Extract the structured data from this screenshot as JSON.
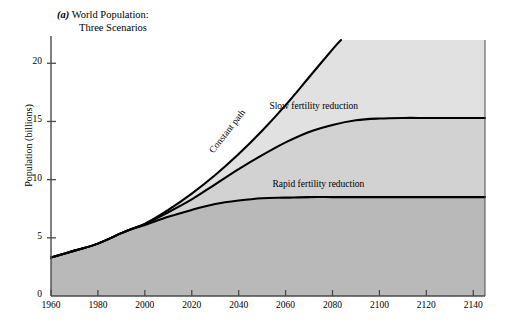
{
  "figure": {
    "panel_letter": "(a)",
    "title_line1": "World Population:",
    "title_line2": "Three Scenarios"
  },
  "colors": {
    "band_top": "#e1e1e1",
    "band_middle": "#d2d2d2",
    "band_bottom": "#b9b9b9",
    "curve": "#000000",
    "axis": "#4a4a4a",
    "background": "#ffffff"
  },
  "chart_data": {
    "type": "line",
    "title": "(a) World Population: Three Scenarios",
    "xlabel": "",
    "ylabel": "Population (billions)",
    "xlim": [
      1960,
      2145
    ],
    "ylim": [
      0,
      22
    ],
    "grid": false,
    "legend": "inline-curve-labels",
    "xticks": [
      1960,
      1980,
      2000,
      2020,
      2040,
      2060,
      2080,
      2100,
      2120,
      2140
    ],
    "yticks": [
      0,
      5,
      10,
      15,
      20
    ],
    "origin_label": "0",
    "annotations": [
      {
        "text": "Constant path",
        "x": 2030,
        "y": 13.0,
        "rotation": -52
      },
      {
        "text": "Slow fertility reduction",
        "x": 2072,
        "y": 15.9,
        "rotation": 0
      },
      {
        "text": "Rapid fertility reduction",
        "x": 2074,
        "y": 9.2,
        "rotation": 0
      }
    ],
    "series": [
      {
        "name": "Constant path",
        "x": [
          1960,
          1970,
          1980,
          1990,
          1995,
          2000,
          2010,
          2020,
          2030,
          2040,
          2050,
          2060,
          2070,
          2080,
          2085
        ],
        "values": [
          3.3,
          3.9,
          4.5,
          5.4,
          5.8,
          6.2,
          7.4,
          8.8,
          10.4,
          12.2,
          14.2,
          16.4,
          18.8,
          21.2,
          22.3
        ]
      },
      {
        "name": "Slow fertility reduction",
        "x": [
          1960,
          1970,
          1980,
          1990,
          1995,
          2000,
          2010,
          2020,
          2030,
          2040,
          2050,
          2060,
          2070,
          2080,
          2090,
          2100,
          2110,
          2120,
          2130,
          2140,
          2145
        ],
        "values": [
          3.3,
          3.9,
          4.5,
          5.4,
          5.8,
          6.2,
          7.2,
          8.3,
          9.6,
          10.9,
          12.1,
          13.2,
          14.1,
          14.7,
          15.1,
          15.25,
          15.3,
          15.3,
          15.3,
          15.3,
          15.3
        ]
      },
      {
        "name": "Rapid fertility reduction",
        "x": [
          1960,
          1970,
          1980,
          1990,
          1995,
          2000,
          2010,
          2020,
          2030,
          2040,
          2050,
          2060,
          2070,
          2080,
          2090,
          2100,
          2110,
          2120,
          2130,
          2140,
          2145
        ],
        "values": [
          3.3,
          3.9,
          4.5,
          5.4,
          5.8,
          6.1,
          6.8,
          7.4,
          7.9,
          8.2,
          8.4,
          8.45,
          8.5,
          8.5,
          8.5,
          8.5,
          8.5,
          8.5,
          8.5,
          8.5,
          8.5
        ]
      }
    ]
  },
  "axes": {
    "y_axis_title": "Population (billions)"
  }
}
